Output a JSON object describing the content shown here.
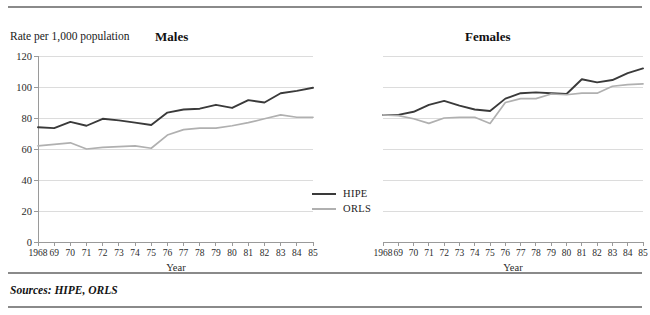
{
  "figure": {
    "y_axis_caption": "Rate per 1,000 population",
    "sources_note": "Sources:  HIPE, ORLS"
  },
  "panels": {
    "males_title": "Males",
    "females_title": "Females",
    "x_axis_name": "Year"
  },
  "legend": {
    "position": "inside-center-bottom",
    "items": [
      {
        "label": "HIPE",
        "color": "#3a3a3a"
      },
      {
        "label": "ORLS",
        "color": "#b0b0b0"
      }
    ]
  },
  "colors": {
    "hipe_line": "#3a3a3a",
    "orls_line": "#b0b0b0",
    "gridline": "#dcdcdc",
    "axis": "#9a9a9a",
    "rule": "#8a8a8a",
    "text": "#1a1a1a"
  },
  "chart_data": [
    {
      "type": "line",
      "title": "Males",
      "xlabel": "Year",
      "ylabel": "Rate per 1,000 population",
      "ylim": [
        0,
        120
      ],
      "yticks": [
        0,
        20,
        40,
        60,
        80,
        100,
        120
      ],
      "ytick_labels": [
        "0",
        "20",
        "40",
        "60",
        "80",
        "100",
        "120"
      ],
      "grid": true,
      "x": [
        1968,
        1969,
        1970,
        1971,
        1972,
        1973,
        1974,
        1975,
        1976,
        1977,
        1978,
        1979,
        1980,
        1981,
        1982,
        1983,
        1984,
        1985
      ],
      "xtick_labels": [
        "1968",
        "69",
        "70",
        "71",
        "72",
        "73",
        "74",
        "75",
        "76",
        "77",
        "78",
        "79",
        "80",
        "81",
        "82",
        "83",
        "84",
        "85"
      ],
      "series": [
        {
          "name": "HIPE",
          "color": "#3a3a3a",
          "values": [
            74,
            73.5,
            77.5,
            75,
            79.5,
            78.5,
            77,
            75.5,
            83.5,
            85.5,
            86,
            88.5,
            86.5,
            91.5,
            90,
            96,
            97.5,
            99.5
          ]
        },
        {
          "name": "ORLS",
          "color": "#b0b0b0",
          "values": [
            62,
            63,
            64,
            60,
            61,
            61.5,
            62,
            60.5,
            69,
            72.5,
            73.5,
            73.5,
            75,
            77,
            79.5,
            82,
            80.5,
            80.5
          ]
        }
      ]
    },
    {
      "type": "line",
      "title": "Females",
      "xlabel": "Year",
      "ylabel": "Rate per 1,000 population",
      "ylim": [
        0,
        120
      ],
      "yticks": [
        0,
        20,
        40,
        60,
        80,
        100,
        120
      ],
      "ytick_labels": [
        "0",
        "20",
        "40",
        "60",
        "80",
        "100",
        "120"
      ],
      "grid": true,
      "x": [
        1968,
        1969,
        1970,
        1971,
        1972,
        1973,
        1974,
        1975,
        1976,
        1977,
        1978,
        1979,
        1980,
        1981,
        1982,
        1983,
        1984,
        1985
      ],
      "xtick_labels": [
        "1968",
        "69",
        "70",
        "71",
        "72",
        "73",
        "74",
        "75",
        "76",
        "77",
        "78",
        "79",
        "80",
        "81",
        "82",
        "83",
        "84",
        "85"
      ],
      "series": [
        {
          "name": "HIPE",
          "color": "#3a3a3a",
          "values": [
            82,
            82,
            84,
            88.5,
            91,
            88,
            85.5,
            84.5,
            92.5,
            96,
            96.5,
            96,
            95.5,
            105,
            103,
            104.5,
            109,
            112
          ]
        },
        {
          "name": "ORLS",
          "color": "#b0b0b0",
          "values": [
            82,
            81.5,
            79.5,
            76.5,
            80,
            80.5,
            80.5,
            76.5,
            90,
            92.5,
            92.5,
            95.5,
            95,
            96,
            96,
            100.5,
            101.5,
            102
          ]
        }
      ]
    }
  ]
}
